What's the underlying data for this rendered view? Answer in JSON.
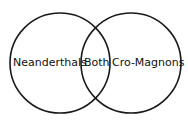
{
  "diagram": {
    "type": "venn",
    "sets": [
      {
        "label": "Neanderthals"
      },
      {
        "label": "Cro-Magnons"
      }
    ],
    "intersection_label": "Both",
    "stroke_color": "#1a1a1a"
  }
}
